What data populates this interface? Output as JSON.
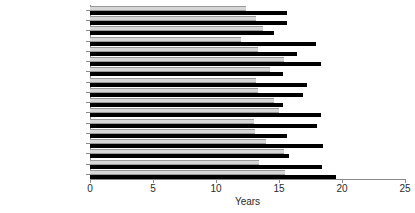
{
  "chart_data": {
    "type": "bar",
    "orientation": "horizontal",
    "title": "",
    "xlabel": "Years",
    "ylabel": "",
    "xlim": [
      0,
      25
    ],
    "xticks": [
      0,
      5,
      10,
      15,
      20,
      25
    ],
    "xtick_labels": [
      "0",
      "5",
      "10",
      "15",
      "20",
      "25"
    ],
    "grid": false,
    "legend": null,
    "categories": [
      "Austria",
      "Belgium",
      "Bulgaria",
      "Czech Republic",
      "Denmark",
      "Finland",
      "France",
      "Hungary",
      "Iceland",
      "Italy",
      "Netherlands",
      "Norway",
      "Slovak Republic",
      "Spain",
      "Sweden",
      "Switzerland",
      ""
    ],
    "series": [
      {
        "name": "light",
        "color": "#d6d6d6",
        "values": [
          12.4,
          13.2,
          13.7,
          12.0,
          13.3,
          15.4,
          14.3,
          13.2,
          13.3,
          14.6,
          15.0,
          13.0,
          13.1,
          14.0,
          15.4,
          13.4,
          15.5
        ]
      },
      {
        "name": "dark",
        "color": "#000000",
        "values": [
          15.6,
          15.6,
          14.6,
          17.9,
          16.4,
          18.3,
          15.3,
          17.2,
          16.9,
          15.3,
          18.3,
          18.0,
          15.6,
          18.5,
          15.8,
          18.4,
          19.5
        ]
      }
    ]
  },
  "colors": {
    "light_bar": "#d6d6d6",
    "dark_bar": "#000000",
    "axis": "#8a8a8a",
    "text": "#1a1a1a",
    "background": "#ffffff"
  }
}
